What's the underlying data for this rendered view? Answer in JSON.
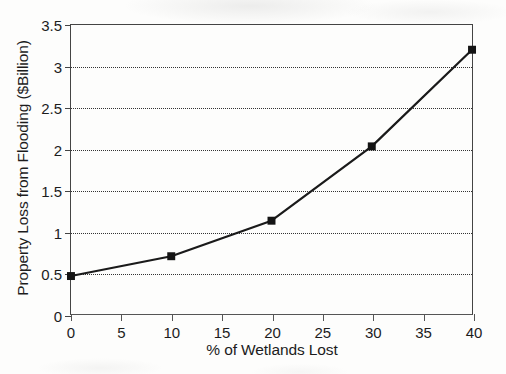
{
  "chart_data": {
    "type": "line",
    "title": "",
    "xlabel": "% of Wetlands Lost",
    "ylabel": "Property Loss from Flooding ($Billion)",
    "x": [
      0,
      10,
      20,
      30,
      40
    ],
    "values": [
      0.46,
      0.7,
      1.13,
      2.03,
      3.2
    ],
    "series": [
      {
        "name": "Property Loss from Flooding",
        "values": [
          0.46,
          0.7,
          1.13,
          2.03,
          3.2
        ]
      }
    ],
    "xlim": [
      0,
      40
    ],
    "ylim": [
      0,
      3.5
    ],
    "xticks": [
      0,
      5,
      10,
      15,
      20,
      25,
      30,
      35,
      40
    ],
    "xtick_labels": [
      "0",
      "5",
      "10",
      "15",
      "20",
      "25",
      "30",
      "35",
      "40"
    ],
    "yticks": [
      0,
      0.5,
      1,
      1.5,
      2,
      2.5,
      3,
      3.5
    ],
    "ytick_labels": [
      "0",
      "0.5",
      "1",
      "1.5",
      "2",
      "2.5",
      "3",
      "3.5"
    ],
    "grid": "horizontal-dotted",
    "legend": "none",
    "marker": "square",
    "line_color": "#1a1a1a",
    "marker_color": "#141414",
    "grid_color": "#333333",
    "axis_color": "#444444",
    "background_color": "#fdfdfc"
  }
}
